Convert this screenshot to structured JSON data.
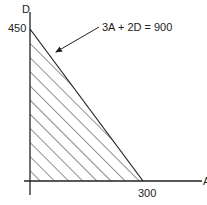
{
  "diagram": {
    "type": "feasible-region-graph",
    "equation_label": "3A + 2D = 900",
    "y_axis": {
      "label": "D",
      "intercept_label": "450",
      "intercept_value": 450
    },
    "x_axis": {
      "label": "A",
      "intercept_label": "300",
      "intercept_value": 300
    },
    "region": {
      "description": "shaded triangle below constraint line",
      "fill": "hatched"
    },
    "colors": {
      "line": "#222222",
      "background": "#ffffff"
    }
  }
}
